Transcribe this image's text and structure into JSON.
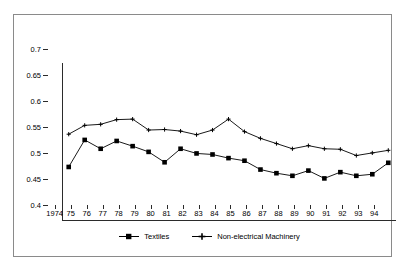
{
  "chart_data": {
    "type": "line",
    "title": "",
    "subtitle": "",
    "xlabel": "",
    "ylabel": "",
    "ylim": [
      0.4,
      0.7
    ],
    "ytick_labels": [
      "0.7",
      "0.65",
      "0.6",
      "0.55",
      "0.5",
      "0.45",
      "0.4"
    ],
    "ytick_values": [
      0.7,
      0.65,
      0.6,
      0.55,
      0.5,
      0.45,
      0.4
    ],
    "grid": false,
    "legend_position": "bottom",
    "categories": [
      "1974",
      "75",
      "76",
      "77",
      "78",
      "79",
      "80",
      "81",
      "82",
      "83",
      "84",
      "85",
      "86",
      "87",
      "88",
      "89",
      "90",
      "91",
      "92",
      "93",
      "94"
    ],
    "series": [
      {
        "name": "Textiles",
        "marker": "square",
        "values": [
          0.502,
          0.554,
          0.537,
          0.552,
          0.542,
          0.531,
          0.511,
          0.537,
          0.528,
          0.526,
          0.519,
          0.514,
          0.497,
          0.49,
          0.485,
          0.495,
          0.48,
          0.492,
          0.485,
          0.488,
          0.51
        ]
      },
      {
        "name": "Non-electrical Machinery",
        "marker": "plus",
        "values": [
          0.565,
          0.582,
          0.584,
          0.593,
          0.594,
          0.573,
          0.574,
          0.571,
          0.564,
          0.573,
          0.594,
          0.57,
          0.557,
          0.547,
          0.537,
          0.543,
          0.537,
          0.536,
          0.524,
          0.529,
          0.534
        ]
      }
    ]
  },
  "legend": {
    "items": [
      {
        "label": "Textiles"
      },
      {
        "label": "Non-electrical Machinery"
      }
    ]
  },
  "colors": {
    "line": "#000000",
    "axis": "#2b2b2b",
    "frame": "#8a8a8a",
    "background": "#ffffff"
  }
}
